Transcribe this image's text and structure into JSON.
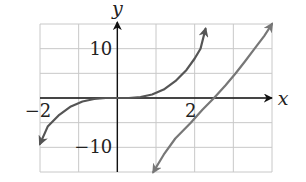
{
  "chart_data": {
    "type": "line",
    "title": "",
    "xlabel": "x",
    "ylabel": "y",
    "xlim": [
      -2,
      4
    ],
    "ylim": [
      -15,
      15
    ],
    "grid": true,
    "x_grid_step": 1,
    "y_grid_step": 5,
    "x_tick_labels": [
      {
        "value": -2,
        "label": "−2"
      },
      {
        "value": 2,
        "label": "2"
      }
    ],
    "y_tick_labels": [
      {
        "value": 10,
        "label": "10"
      },
      {
        "value": -10,
        "label": "−10"
      }
    ],
    "series": [
      {
        "name": "curve-1",
        "color": "#555555",
        "arrows": "both",
        "points": [
          [
            -2.0,
            -9.3
          ],
          [
            -1.8,
            -5.8
          ],
          [
            -1.5,
            -3.4
          ],
          [
            -1.2,
            -1.7
          ],
          [
            -0.9,
            -0.7
          ],
          [
            -0.6,
            -0.2
          ],
          [
            -0.3,
            0.0
          ],
          [
            0,
            0
          ],
          [
            0.3,
            0.0
          ],
          [
            0.6,
            0.2
          ],
          [
            0.9,
            0.7
          ],
          [
            1.2,
            1.7
          ],
          [
            1.5,
            3.4
          ],
          [
            1.79,
            5.7
          ],
          [
            2.0,
            8.0
          ],
          [
            2.15,
            10.0
          ],
          [
            2.28,
            14.0
          ]
        ]
      },
      {
        "name": "curve-2",
        "color": "#777777",
        "arrows": "both",
        "points": [
          [
            0.93,
            -15.0
          ],
          [
            1.2,
            -11.5
          ],
          [
            1.5,
            -8.2
          ],
          [
            1.9,
            -5.0
          ],
          [
            2.2,
            -2.4
          ],
          [
            2.5,
            0.0
          ],
          [
            2.8,
            2.6
          ],
          [
            3.06,
            5.0
          ],
          [
            3.3,
            7.4
          ],
          [
            3.55,
            10.0
          ],
          [
            3.8,
            12.6
          ],
          [
            4.0,
            15.0
          ]
        ]
      }
    ]
  }
}
